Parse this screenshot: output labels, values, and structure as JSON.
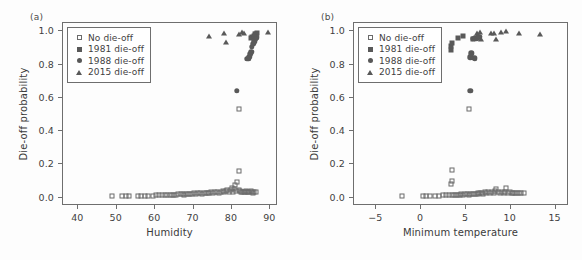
{
  "figure": {
    "background": "#fdfdfd",
    "marker_color": "#595959",
    "axis_color": "#6e6e6e"
  },
  "panels": [
    {
      "tag": "(a)",
      "chart_data": {
        "type": "scatter",
        "title": "",
        "xlabel": "Humidity",
        "ylabel": "Die-off probability",
        "xlim": [
          36,
          92
        ],
        "ylim": [
          -0.05,
          1.05
        ],
        "xticks": [
          40,
          50,
          60,
          70,
          80,
          90
        ],
        "yticks": [
          "0.0",
          "0.2",
          "0.4",
          "0.6",
          "0.8",
          "1.0"
        ],
        "grid": false,
        "legend_position": "top-left",
        "series": [
          {
            "name": "No die-off",
            "marker": "square-open",
            "points": [
              [
                48.9,
                0.005
              ],
              [
                51.6,
                0.005
              ],
              [
                52.6,
                0.005
              ],
              [
                53.4,
                0.005
              ],
              [
                55.9,
                0.006
              ],
              [
                56.7,
                0.006
              ],
              [
                57.5,
                0.006
              ],
              [
                58.4,
                0.007
              ],
              [
                59.6,
                0.007
              ],
              [
                60.4,
                0.008
              ],
              [
                61.2,
                0.008
              ],
              [
                62.0,
                0.009
              ],
              [
                62.8,
                0.01
              ],
              [
                63.4,
                0.01
              ],
              [
                64.0,
                0.011
              ],
              [
                64.6,
                0.012
              ],
              [
                65.2,
                0.012
              ],
              [
                65.8,
                0.013
              ],
              [
                66.3,
                0.014
              ],
              [
                66.9,
                0.015
              ],
              [
                67.4,
                0.016
              ],
              [
                67.9,
                0.012
              ],
              [
                68.4,
                0.017
              ],
              [
                68.9,
                0.018
              ],
              [
                69.4,
                0.014
              ],
              [
                69.9,
                0.019
              ],
              [
                70.4,
                0.02
              ],
              [
                70.9,
                0.016
              ],
              [
                71.4,
                0.021
              ],
              [
                71.9,
                0.022
              ],
              [
                72.4,
                0.018
              ],
              [
                72.9,
                0.023
              ],
              [
                73.4,
                0.024
              ],
              [
                73.9,
                0.02
              ],
              [
                74.4,
                0.025
              ],
              [
                74.9,
                0.026
              ],
              [
                75.4,
                0.022
              ],
              [
                75.9,
                0.027
              ],
              [
                76.4,
                0.028
              ],
              [
                76.9,
                0.024
              ],
              [
                77.4,
                0.03
              ],
              [
                77.9,
                0.032
              ],
              [
                78.3,
                0.026
              ],
              [
                78.7,
                0.034
              ],
              [
                79.1,
                0.042
              ],
              [
                79.5,
                0.028
              ],
              [
                79.9,
                0.038
              ],
              [
                80.2,
                0.055
              ],
              [
                80.5,
                0.03
              ],
              [
                80.8,
                0.045
              ],
              [
                81.1,
                0.07
              ],
              [
                81.4,
                0.034
              ],
              [
                81.7,
                0.088
              ],
              [
                82.0,
                0.04
              ],
              [
                82.1,
                0.152
              ],
              [
                82.2,
                0.53
              ],
              [
                82.4,
                0.036
              ],
              [
                82.7,
                0.03
              ],
              [
                83.0,
                0.028
              ],
              [
                83.3,
                0.026
              ],
              [
                83.6,
                0.03
              ],
              [
                83.9,
                0.032
              ],
              [
                84.2,
                0.028
              ],
              [
                84.5,
                0.026
              ],
              [
                84.8,
                0.03
              ],
              [
                85.1,
                0.034
              ],
              [
                85.4,
                0.028
              ],
              [
                85.7,
                0.024
              ],
              [
                86.0,
                0.03
              ],
              [
                86.4,
                0.028
              ]
            ]
          },
          {
            "name": "1981 die-off",
            "marker": "square-filled",
            "points": [
              [
                85.3,
                0.955
              ],
              [
                85.6,
                0.962
              ],
              [
                86.0,
                0.968
              ],
              [
                86.3,
                0.975
              ],
              [
                86.6,
                0.98
              ],
              [
                86.9,
                0.985
              ]
            ]
          },
          {
            "name": "1988 die-off",
            "marker": "circle-filled",
            "points": [
              [
                81.6,
                0.638
              ],
              [
                84.2,
                0.828
              ],
              [
                84.5,
                0.828
              ],
              [
                84.8,
                0.842
              ],
              [
                85.0,
                0.858
              ],
              [
                85.3,
                0.872
              ],
              [
                85.5,
                0.9
              ],
              [
                85.8,
                0.918
              ],
              [
                86.1,
                0.935
              ],
              [
                86.4,
                0.948
              ],
              [
                86.7,
                0.958
              ]
            ]
          },
          {
            "name": "2015 die-off",
            "marker": "triangle-filled",
            "points": [
              [
                74.3,
                0.965
              ],
              [
                78.2,
                0.982
              ],
              [
                78.6,
                0.928
              ],
              [
                82.2,
                0.98
              ],
              [
                83.0,
                0.988
              ],
              [
                83.4,
                0.985
              ],
              [
                86.0,
                0.978
              ],
              [
                89.6,
                0.99
              ]
            ]
          }
        ]
      }
    },
    {
      "tag": "(b)",
      "chart_data": {
        "type": "scatter",
        "title": "",
        "xlabel": "Minimum temperature",
        "ylabel": "Die-off probability",
        "xlim": [
          -7.5,
          16.5
        ],
        "ylim": [
          -0.05,
          1.05
        ],
        "xticks": [
          "-5",
          "0",
          "5",
          "10",
          "15"
        ],
        "yticks": [
          "0.0",
          "0.2",
          "0.4",
          "0.6",
          "0.8",
          "1.0"
        ],
        "grid": false,
        "legend_position": "top-left",
        "series": [
          {
            "name": "No die-off",
            "marker": "square-open",
            "points": [
              [
                -2.0,
                0.005
              ],
              [
                0.3,
                0.006
              ],
              [
                0.7,
                0.006
              ],
              [
                1.1,
                0.006
              ],
              [
                1.6,
                0.007
              ],
              [
                2.1,
                0.007
              ],
              [
                2.5,
                0.008
              ],
              [
                2.9,
                0.008
              ],
              [
                3.2,
                0.009
              ],
              [
                3.4,
                0.076
              ],
              [
                3.5,
                0.16
              ],
              [
                3.5,
                0.092
              ],
              [
                3.6,
                0.01
              ],
              [
                3.8,
                0.011
              ],
              [
                4.0,
                0.012
              ],
              [
                4.2,
                0.013
              ],
              [
                4.4,
                0.01
              ],
              [
                4.6,
                0.014
              ],
              [
                4.8,
                0.012
              ],
              [
                5.0,
                0.015
              ],
              [
                5.2,
                0.016
              ],
              [
                5.4,
                0.013
              ],
              [
                5.5,
                0.53
              ],
              [
                5.6,
                0.017
              ],
              [
                5.8,
                0.018
              ],
              [
                6.0,
                0.014
              ],
              [
                6.2,
                0.019
              ],
              [
                6.4,
                0.02
              ],
              [
                6.5,
                0.016
              ],
              [
                6.7,
                0.022
              ],
              [
                6.9,
                0.024
              ],
              [
                7.0,
                0.018
              ],
              [
                7.2,
                0.026
              ],
              [
                7.4,
                0.02
              ],
              [
                7.6,
                0.028
              ],
              [
                7.8,
                0.022
              ],
              [
                8.0,
                0.03
              ],
              [
                8.2,
                0.024
              ],
              [
                8.4,
                0.032
              ],
              [
                8.5,
                0.046
              ],
              [
                8.7,
                0.026
              ],
              [
                8.9,
                0.02
              ],
              [
                9.1,
                0.028
              ],
              [
                9.3,
                0.022
              ],
              [
                9.5,
                0.03
              ],
              [
                9.6,
                0.055
              ],
              [
                9.8,
                0.024
              ],
              [
                10.0,
                0.026
              ],
              [
                10.2,
                0.02
              ],
              [
                10.4,
                0.022
              ],
              [
                10.6,
                0.024
              ],
              [
                10.8,
                0.02
              ],
              [
                11.0,
                0.022
              ],
              [
                11.3,
                0.02
              ],
              [
                11.6,
                0.022
              ]
            ]
          },
          {
            "name": "1981 die-off",
            "marker": "square-filled",
            "points": [
              [
                3.4,
                0.88
              ],
              [
                3.4,
                0.908
              ],
              [
                3.6,
                0.925
              ],
              [
                4.2,
                0.952
              ],
              [
                4.8,
                0.968
              ],
              [
                5.9,
                0.948
              ]
            ]
          },
          {
            "name": "1988 die-off",
            "marker": "circle-filled",
            "points": [
              [
                5.6,
                0.638
              ],
              [
                5.6,
                0.838
              ],
              [
                5.9,
                0.835
              ],
              [
                6.1,
                0.832
              ],
              [
                5.7,
                0.862
              ],
              [
                5.9,
                0.948
              ],
              [
                6.1,
                0.952
              ],
              [
                6.3,
                0.95
              ],
              [
                6.4,
                0.958
              ],
              [
                6.6,
                0.962
              ]
            ]
          },
          {
            "name": "2015 die-off",
            "marker": "triangle-filled",
            "points": [
              [
                6.3,
                0.985
              ],
              [
                6.7,
                0.988
              ],
              [
                6.8,
                0.948
              ],
              [
                7.9,
                0.985
              ],
              [
                8.2,
                0.982
              ],
              [
                8.5,
                0.945
              ],
              [
                9.0,
                0.99
              ],
              [
                9.6,
                0.995
              ],
              [
                11.0,
                0.982
              ],
              [
                13.4,
                0.975
              ]
            ]
          }
        ]
      }
    }
  ],
  "legend": {
    "entries": [
      {
        "label": "No die-off",
        "marker": "square-open"
      },
      {
        "label": "1981 die-off",
        "marker": "square-filled"
      },
      {
        "label": "1988 die-off",
        "marker": "circle-filled"
      },
      {
        "label": "2015 die-off",
        "marker": "triangle-filled"
      }
    ]
  }
}
